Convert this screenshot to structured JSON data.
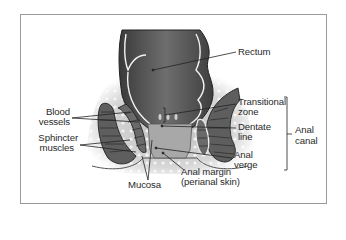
{
  "diagram": {
    "title": "",
    "labels": {
      "rectum": "Rectum",
      "transitional_zone_1": "Transitional",
      "transitional_zone_2": "zone",
      "dentate_line_1": "Dentate",
      "dentate_line_2": "line",
      "anal_verge_1": "Anal",
      "anal_verge_2": "verge",
      "anal_margin_1": "Anal margin",
      "anal_margin_2": "(perianal skin)",
      "anal_canal_1": "Anal",
      "anal_canal_2": "canal",
      "blood_vessels_1": "Blood",
      "blood_vessels_2": "vessels",
      "sphincter_muscles_1": "Sphincter",
      "sphincter_muscles_2": "muscles",
      "mucosa": "Mucosa"
    },
    "colors": {
      "frame": "#9a9a9a",
      "tissue_dark": "#4a4a4a",
      "tissue_mid": "#7a7a7a",
      "mucosa": "#a8a8a8",
      "fat": "#d9d9d9",
      "leader": "#222222"
    }
  }
}
